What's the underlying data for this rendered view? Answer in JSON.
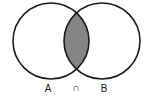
{
  "diagram": {
    "type": "venn",
    "sets": [
      {
        "id": "A",
        "label": "A"
      },
      {
        "id": "B",
        "label": "B"
      }
    ],
    "operator": {
      "symbol": "∩",
      "meaning": "intersection"
    },
    "highlighted_region": "A ∩ B",
    "colors": {
      "outline": "#1a1a1a",
      "shade": "#858585",
      "background": "#ffffff"
    }
  }
}
